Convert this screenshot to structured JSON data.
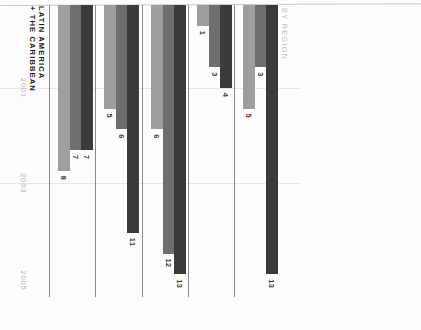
{
  "caption": "BY REGION",
  "axis": {
    "years": [
      "2001",
      "2003",
      "2005"
    ],
    "max": 14,
    "grid": true
  },
  "legend_colors": {
    "year_2001": "#9e9e9e",
    "year_2003": "#6e6e6e",
    "year_2005": "#3b3b3b"
  },
  "chart_data": {
    "type": "bar",
    "title": "BY REGION",
    "xlabel": "",
    "ylabel": "",
    "orientation": "horizontal",
    "grid": true,
    "legend_position": "none",
    "axis_ticks": [
      "2001",
      "2003",
      "2005"
    ],
    "xlim": [
      0,
      14
    ],
    "categories": [
      "AFRICA",
      "ARAB STATES",
      "ASIA + THE PACIFIC",
      "EUROPE",
      "LATIN AMERICA + THE CARIBBEAN"
    ],
    "series": [
      {
        "name": "2001",
        "color": "#9e9e9e",
        "values": [
          5,
          1,
          6,
          5,
          8
        ]
      },
      {
        "name": "2003",
        "color": "#6e6e6e",
        "values": [
          3,
          3,
          12,
          6,
          7
        ]
      },
      {
        "name": "2005",
        "color": "#3b3b3b",
        "values": [
          13,
          4,
          13,
          11,
          7
        ]
      }
    ]
  },
  "regions": [
    {
      "label": "AFRICA",
      "label_lines": [
        "AFRICA"
      ],
      "bars": [
        {
          "year": "2005",
          "value": "13",
          "tone": "c-dark"
        },
        {
          "year": "2003",
          "value": "3",
          "tone": "c-mid"
        },
        {
          "year": "2001",
          "value": "5",
          "tone": "c-light"
        }
      ]
    },
    {
      "label": "ARAB STATES",
      "label_lines": [
        "ARAB STATES"
      ],
      "bars": [
        {
          "year": "2005",
          "value": "4",
          "tone": "c-dark"
        },
        {
          "year": "2003",
          "value": "3",
          "tone": "c-mid"
        },
        {
          "year": "2001",
          "value": "1",
          "tone": "c-light"
        }
      ]
    },
    {
      "label": "ASIA + THE PACIFIC",
      "label_lines": [
        "ASIA + THE PACIFIC"
      ],
      "bars": [
        {
          "year": "2005",
          "value": "13",
          "tone": "c-dark"
        },
        {
          "year": "2003",
          "value": "12",
          "tone": "c-mid"
        },
        {
          "year": "2001",
          "value": "6",
          "tone": "c-light"
        }
      ]
    },
    {
      "label": "EUROPE",
      "label_lines": [
        "EUROPE"
      ],
      "bars": [
        {
          "year": "2005",
          "value": "11",
          "tone": "c-dark"
        },
        {
          "year": "2003",
          "value": "6",
          "tone": "c-mid"
        },
        {
          "year": "2001",
          "value": "5",
          "tone": "c-light"
        }
      ]
    },
    {
      "label": "LATIN AMERICA + THE CARIBBEAN",
      "label_lines": [
        "LATIN AMERICA",
        "+ THE CARIBBEAN"
      ],
      "bars": [
        {
          "year": "2005",
          "value": "7",
          "tone": "c-dark"
        },
        {
          "year": "2003",
          "value": "7",
          "tone": "c-mid"
        },
        {
          "year": "2001",
          "value": "8",
          "tone": "c-light"
        }
      ]
    }
  ]
}
